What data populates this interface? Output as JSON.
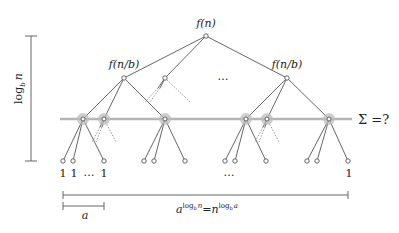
{
  "diagram": {
    "root_label": "f(n)",
    "level1_left_label": "f(n/b)",
    "level1_right_label": "f(n/b)",
    "level1_ellipsis": "…",
    "sum_label": "Σ =?",
    "height_label": "log",
    "height_label_sub": "b",
    "height_label_var": "n",
    "leaf_labels": [
      "1",
      "1",
      "…",
      "1"
    ],
    "leaf_middle_ellipsis": "…",
    "leaf_last_label": "1",
    "branch_width_label": "a",
    "total_width_label_base": "a",
    "total_width_label_exp1": "log",
    "total_width_label_exp1_sub": "b",
    "total_width_label_exp1_var": "n",
    "total_width_label_eq": "=",
    "total_width_label_base2": "n",
    "total_width_label_exp2": "log",
    "total_width_label_exp2_sub": "b",
    "total_width_label_exp2_var": "a",
    "colors": {
      "edge": "#555555",
      "level_line": "#b5b5b5",
      "node_halo": "#bdbdbd",
      "dotted_edge": "#8a8a8a"
    }
  }
}
